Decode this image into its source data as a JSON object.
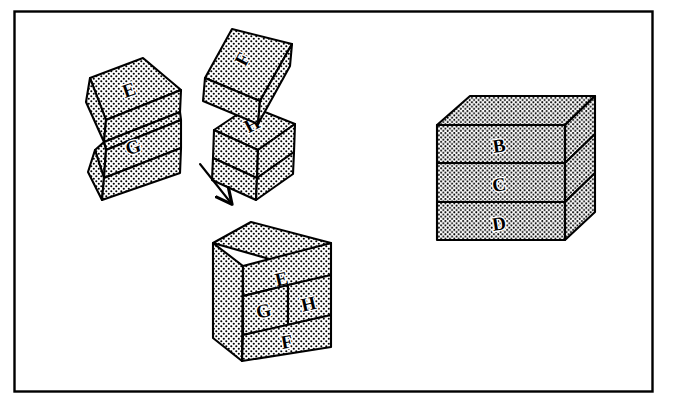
{
  "figure": {
    "border_color": "#000000",
    "ink_color": "#000000",
    "paper_color": "#ffffff",
    "stipple_color": "#000000",
    "frame": {
      "x": 14,
      "y": 11,
      "width": 639,
      "height": 381
    }
  },
  "labels": {
    "left_group": {
      "top_slab": "E",
      "bottom_slab": "G"
    },
    "middle_group": {
      "tilted_slab": "F",
      "small_block": "H"
    },
    "assembled_block": {
      "top_row": "E",
      "middle_left": "G",
      "middle_right": "H",
      "bottom_row": "F"
    },
    "right_cube": {
      "top_slab": "B",
      "middle_slab": "C",
      "bottom_slab": "D"
    }
  },
  "arrow": {
    "name": "assembly-arrow",
    "direction": "down-right",
    "from": [
      200,
      164
    ],
    "to": [
      234,
      207
    ]
  }
}
